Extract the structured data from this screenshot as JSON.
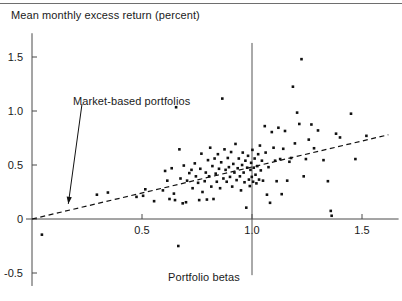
{
  "figure": {
    "title_y": "Mean monthly excess return (percent)",
    "title_x": "Portfolio betas",
    "annotation": "Market-based portfolios"
  },
  "chart_data": {
    "type": "scatter",
    "title": "",
    "ylabel": "Mean monthly excess return (percent)",
    "xlabel": "Portfolio betas",
    "xlim": [
      -0.03,
      1.63
    ],
    "ylim": [
      -0.62,
      1.72
    ],
    "xticks": [
      0.5,
      1.0,
      1.5
    ],
    "xtick_labels": [
      "0.5",
      "1.0",
      "1.5"
    ],
    "yticks": [
      -0.5,
      0,
      0.5,
      1.0,
      1.5
    ],
    "ytick_labels": [
      "-0.5",
      "0",
      "0.5",
      "1.0",
      "1.5"
    ],
    "grid": false,
    "legend": null,
    "marker": "square-dot",
    "marker_color": "#111111",
    "marker_size_px": 2.6,
    "fit_line": {
      "style": "dashed",
      "color": "#111111",
      "x0": 0.0,
      "y0": 0.0,
      "x1": 1.62,
      "y1": 0.78,
      "slope": 0.481,
      "intercept": 0.0,
      "label": "Market-based portfolios"
    },
    "reference_line": {
      "orientation": "vertical",
      "x": 1.0,
      "color": "#555555",
      "y_top": 1.63,
      "y_bottom": -0.52
    },
    "annotation_arrow": {
      "text": "Market-based portfolios",
      "text_x": 0.185,
      "text_y": 1.07,
      "tip_x": 0.165,
      "tip_y": 0.14
    },
    "points": [
      [
        0.045,
        -0.145
      ],
      [
        0.295,
        0.225
      ],
      [
        0.345,
        0.245
      ],
      [
        0.475,
        0.205
      ],
      [
        0.505,
        0.215
      ],
      [
        0.515,
        0.275
      ],
      [
        0.555,
        0.165
      ],
      [
        0.595,
        0.265
      ],
      [
        0.605,
        0.445
      ],
      [
        0.615,
        0.355
      ],
      [
        0.625,
        0.185
      ],
      [
        0.635,
        0.47
      ],
      [
        0.645,
        0.235
      ],
      [
        0.65,
        0.175
      ],
      [
        0.655,
        1.035
      ],
      [
        0.665,
        -0.25
      ],
      [
        0.67,
        0.645
      ],
      [
        0.675,
        0.375
      ],
      [
        0.685,
        0.145
      ],
      [
        0.69,
        0.495
      ],
      [
        0.7,
        0.155
      ],
      [
        0.705,
        0.355
      ],
      [
        0.715,
        0.425
      ],
      [
        0.725,
        0.455
      ],
      [
        0.73,
        0.285
      ],
      [
        0.74,
        0.515
      ],
      [
        0.745,
        0.395
      ],
      [
        0.755,
        0.335
      ],
      [
        0.76,
        0.175
      ],
      [
        0.765,
        0.465
      ],
      [
        0.77,
        0.605
      ],
      [
        0.775,
        0.25
      ],
      [
        0.785,
        0.35
      ],
      [
        0.79,
        0.43
      ],
      [
        0.795,
        0.18
      ],
      [
        0.8,
        0.545
      ],
      [
        0.805,
        0.395
      ],
      [
        0.81,
        0.66
      ],
      [
        0.815,
        0.3
      ],
      [
        0.82,
        0.49
      ],
      [
        0.825,
        0.185
      ],
      [
        0.83,
        0.56
      ],
      [
        0.835,
        0.42
      ],
      [
        0.84,
        0.345
      ],
      [
        0.845,
        0.6
      ],
      [
        0.85,
        0.465
      ],
      [
        0.855,
        0.285
      ],
      [
        0.86,
        0.525
      ],
      [
        0.865,
        1.115
      ],
      [
        0.87,
        0.375
      ],
      [
        0.875,
        0.645
      ],
      [
        0.88,
        0.455
      ],
      [
        0.885,
        0.345
      ],
      [
        0.89,
        0.565
      ],
      [
        0.895,
        0.48
      ],
      [
        0.9,
        0.39
      ],
      [
        0.905,
        0.62
      ],
      [
        0.91,
        0.3
      ],
      [
        0.915,
        0.51
      ],
      [
        0.92,
        0.43
      ],
      [
        0.925,
        0.695
      ],
      [
        0.93,
        0.36
      ],
      [
        0.935,
        0.47
      ],
      [
        0.94,
        0.56
      ],
      [
        0.945,
        0.395
      ],
      [
        0.95,
        0.265
      ],
      [
        0.955,
        0.5
      ],
      [
        0.958,
        0.615
      ],
      [
        0.962,
        0.43
      ],
      [
        0.966,
        0.34
      ],
      [
        0.97,
        0.54
      ],
      [
        0.974,
        0.105
      ],
      [
        0.978,
        0.475
      ],
      [
        0.982,
        0.585
      ],
      [
        0.986,
        0.365
      ],
      [
        0.99,
        0.305
      ],
      [
        0.993,
        0.455
      ],
      [
        0.996,
        0.52
      ],
      [
        0.999,
        0.39
      ],
      [
        1.002,
        0.64
      ],
      [
        1.005,
        0.345
      ],
      [
        1.008,
        0.475
      ],
      [
        1.012,
        0.56
      ],
      [
        1.016,
        0.41
      ],
      [
        1.02,
        0.33
      ],
      [
        1.024,
        0.49
      ],
      [
        1.028,
        0.6
      ],
      [
        1.032,
        0.365
      ],
      [
        1.036,
        0.68
      ],
      [
        1.04,
        0.45
      ],
      [
        1.045,
        0.54
      ],
      [
        1.05,
        0.355
      ],
      [
        1.058,
        0.86
      ],
      [
        1.062,
        0.615
      ],
      [
        1.068,
        0.225
      ],
      [
        1.075,
        0.48
      ],
      [
        1.082,
        0.15
      ],
      [
        1.09,
        0.805
      ],
      [
        1.098,
        0.66
      ],
      [
        1.105,
        0.54
      ],
      [
        1.112,
        0.35
      ],
      [
        1.12,
        0.845
      ],
      [
        1.128,
        0.555
      ],
      [
        1.135,
        0.23
      ],
      [
        1.142,
        0.65
      ],
      [
        1.15,
        0.815
      ],
      [
        1.16,
        0.355
      ],
      [
        1.17,
        0.53
      ],
      [
        1.178,
        0.565
      ],
      [
        1.186,
        1.225
      ],
      [
        1.195,
        0.7
      ],
      [
        1.205,
        0.985
      ],
      [
        1.215,
        0.88
      ],
      [
        1.225,
        1.48
      ],
      [
        1.235,
        0.395
      ],
      [
        1.245,
        0.555
      ],
      [
        1.258,
        0.735
      ],
      [
        1.27,
        0.875
      ],
      [
        1.282,
        0.655
      ],
      [
        1.3,
        0.82
      ],
      [
        1.325,
        0.545
      ],
      [
        1.345,
        0.35
      ],
      [
        1.358,
        0.075
      ],
      [
        1.362,
        0.03
      ],
      [
        1.382,
        0.79
      ],
      [
        1.4,
        0.755
      ],
      [
        1.45,
        0.975
      ],
      [
        1.47,
        0.555
      ],
      [
        1.52,
        0.77
      ]
    ]
  }
}
